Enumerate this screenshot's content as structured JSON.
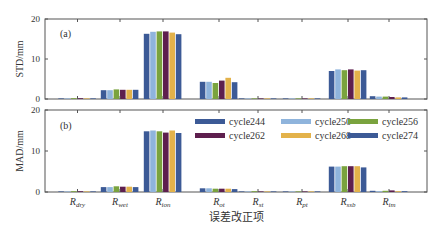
{
  "chart_data": [
    {
      "type": "bar",
      "panel_label": "(a)",
      "ylabel": "STD/mm",
      "ylim": [
        0,
        20
      ],
      "yticks": [
        0,
        10,
        20
      ],
      "categories": [
        "R_dry",
        "R_wet",
        "R_ion",
        "R_ot",
        "R_st",
        "R_pt",
        "R_ssb",
        "R_im"
      ],
      "series": [
        {
          "name": "cycle244",
          "color": "#3c5a96",
          "values": [
            0.1,
            2.2,
            16.3,
            4.3,
            0.1,
            0.0,
            7.0,
            0.7
          ]
        },
        {
          "name": "cycle250",
          "color": "#8fb4dc",
          "values": [
            0.1,
            2.2,
            16.8,
            4.3,
            0.1,
            0.0,
            7.4,
            0.6
          ]
        },
        {
          "name": "cycle256",
          "color": "#7aa33e",
          "values": [
            0.2,
            2.4,
            16.9,
            4.0,
            0.1,
            0.0,
            7.2,
            0.6
          ]
        },
        {
          "name": "cycle262",
          "color": "#5e1f4e",
          "values": [
            0.2,
            2.3,
            16.9,
            4.6,
            0.1,
            0.0,
            7.4,
            0.5
          ]
        },
        {
          "name": "cycle268",
          "color": "#e3b24a",
          "values": [
            0.1,
            2.3,
            16.6,
            5.3,
            0.1,
            0.0,
            7.1,
            0.4
          ]
        },
        {
          "name": "cycle274",
          "color": "#3c5a96",
          "values": [
            0.1,
            2.3,
            16.2,
            4.2,
            0.1,
            0.0,
            7.2,
            0.4
          ]
        }
      ],
      "grid": false,
      "legend": null
    },
    {
      "type": "bar",
      "panel_label": "(b)",
      "ylabel": "MAD/mm",
      "xlabel": "误差改正项",
      "ylim": [
        0,
        20
      ],
      "yticks": [
        0,
        10,
        20
      ],
      "categories": [
        "R_dry",
        "R_wet",
        "R_ion",
        "R_ot",
        "R_st",
        "R_pt",
        "R_ssb",
        "R_im"
      ],
      "series": [
        {
          "name": "cycle244",
          "color": "#3c5a96",
          "values": [
            0.1,
            1.2,
            14.8,
            0.9,
            0.1,
            0.0,
            6.2,
            0.3
          ]
        },
        {
          "name": "cycle250",
          "color": "#8fb4dc",
          "values": [
            0.1,
            1.2,
            15.0,
            0.9,
            0.1,
            0.0,
            6.2,
            0.2
          ]
        },
        {
          "name": "cycle256",
          "color": "#7aa33e",
          "values": [
            0.2,
            1.4,
            14.8,
            0.8,
            0.2,
            0.0,
            6.3,
            0.3
          ]
        },
        {
          "name": "cycle262",
          "color": "#5e1f4e",
          "values": [
            0.2,
            1.3,
            14.5,
            0.8,
            0.1,
            0.0,
            6.3,
            0.4
          ]
        },
        {
          "name": "cycle268",
          "color": "#e3b24a",
          "values": [
            0.1,
            1.3,
            15.0,
            0.8,
            0.1,
            0.0,
            6.3,
            0.2
          ]
        },
        {
          "name": "cycle274",
          "color": "#3c5a96",
          "values": [
            0.1,
            1.2,
            14.4,
            0.7,
            0.1,
            0.0,
            6.0,
            0.2
          ]
        }
      ],
      "grid": false,
      "legend": {
        "position": "upper right",
        "columns": 3
      }
    }
  ],
  "labels": {
    "panel_a": "(a)",
    "panel_b": "(b)",
    "ylabel_a": "STD/mm",
    "ylabel_b": "MAD/mm",
    "xlabel": "误差改正项",
    "ytick_0": "0",
    "ytick_10": "10",
    "ytick_20": "20"
  },
  "categories_display": [
    {
      "base": "R",
      "sub": "dry"
    },
    {
      "base": "R",
      "sub": "wet"
    },
    {
      "base": "R",
      "sub": "ion"
    },
    {
      "base": "R",
      "sub": "ot"
    },
    {
      "base": "R",
      "sub": "st"
    },
    {
      "base": "R",
      "sub": "pt"
    },
    {
      "base": "R",
      "sub": "ssb"
    },
    {
      "base": "R",
      "sub": "im"
    }
  ],
  "legend": [
    {
      "name": "cycle244",
      "color": "#3c5a96"
    },
    {
      "name": "cycle250",
      "color": "#8fb4dc"
    },
    {
      "name": "cycle256",
      "color": "#7aa33e"
    },
    {
      "name": "cycle262",
      "color": "#5e1f4e"
    },
    {
      "name": "cycle268",
      "color": "#e3b24a"
    },
    {
      "name": "cycle274",
      "color": "#3c5a96"
    }
  ]
}
